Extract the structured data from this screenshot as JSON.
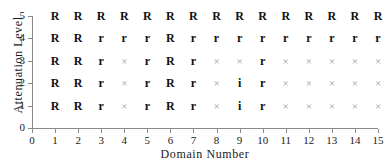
{
  "chart_data": {
    "type": "scatter",
    "title": "",
    "xlabel": "Domain Number",
    "ylabel": "Attenuation Level",
    "xlim": [
      0,
      15
    ],
    "ylim": [
      0,
      5
    ],
    "x_ticks": [
      0,
      1,
      2,
      3,
      4,
      5,
      6,
      7,
      8,
      9,
      10,
      11,
      12,
      13,
      14,
      15
    ],
    "y_ticks": [
      0,
      1,
      2,
      3,
      4,
      5
    ],
    "grid": false,
    "legend": null,
    "marker_symbols": [
      "R",
      "r",
      "i",
      "×"
    ],
    "x": [
      1,
      2,
      3,
      4,
      5,
      6,
      7,
      8,
      9,
      10,
      11,
      12,
      13,
      14,
      15
    ],
    "rows": [
      {
        "y": 5,
        "labels": [
          "R",
          "R",
          "R",
          "R",
          "R",
          "R",
          "R",
          "R",
          "R",
          "R",
          "R",
          "R",
          "R",
          "R",
          "R"
        ]
      },
      {
        "y": 4,
        "labels": [
          "R",
          "R",
          "r",
          "r",
          "r",
          "R",
          "r",
          "r",
          "r",
          "r",
          "r",
          "r",
          "r",
          "r",
          "r"
        ]
      },
      {
        "y": 3,
        "labels": [
          "R",
          "R",
          "r",
          "×",
          "r",
          "R",
          "r",
          "×",
          "×",
          "r",
          "×",
          "×",
          "×",
          "×",
          "×"
        ]
      },
      {
        "y": 2,
        "labels": [
          "R",
          "R",
          "r",
          "×",
          "r",
          "R",
          "r",
          "×",
          "i",
          "r",
          "×",
          "×",
          "×",
          "×",
          "×"
        ]
      },
      {
        "y": 1,
        "labels": [
          "R",
          "R",
          "r",
          "×",
          "r",
          "R",
          "r",
          "×",
          "i",
          "r",
          "×",
          "×",
          "×",
          "×",
          "×"
        ]
      }
    ]
  },
  "colors": {
    "axis": "#8a8a8a",
    "text": "#1a1a1a",
    "marker_bold": "#111111",
    "marker_cross": "#9c9c9c",
    "background": "#ffffff"
  }
}
